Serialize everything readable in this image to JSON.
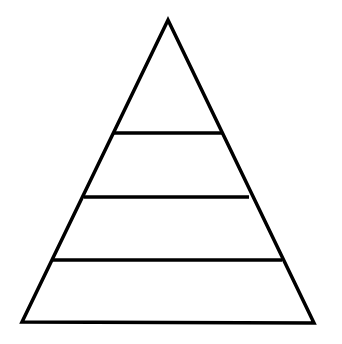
{
  "diagram": {
    "type": "pyramid",
    "levels": 4,
    "labels": [],
    "stroke_color": "#000000",
    "fill_color": "#ffffff",
    "background": "#ffffff",
    "apex": [
      168,
      20
    ],
    "base_left": [
      22,
      322
    ],
    "base_right": [
      314,
      323
    ],
    "dividers": [
      {
        "y": 133,
        "x1": 114,
        "x2": 222
      },
      {
        "y": 197,
        "x1": 84,
        "x2": 249
      },
      {
        "y": 260,
        "x1": 52,
        "x2": 282
      }
    ]
  }
}
